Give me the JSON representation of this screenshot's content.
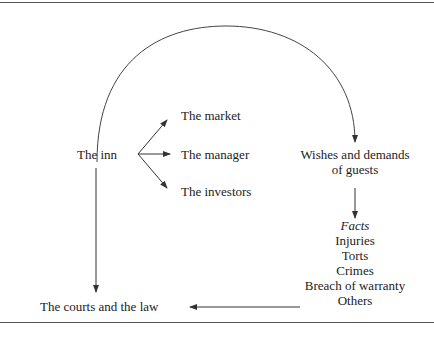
{
  "diagram": {
    "nodes": {
      "inn": "The inn",
      "market": "The market",
      "manager": "The manager",
      "investors": "The investors",
      "wishes_line1": "Wishes and demands",
      "wishes_line2": "of guests",
      "facts_title": "Facts",
      "facts_items": [
        "Injuries",
        "Torts",
        "Crimes",
        "Breach of warranty",
        "Others"
      ],
      "courts": "The courts and the law"
    },
    "edges": [
      {
        "from": "The inn",
        "to": "The market"
      },
      {
        "from": "The inn",
        "to": "The manager"
      },
      {
        "from": "The inn",
        "to": "The investors"
      },
      {
        "from": "The inn",
        "to": "Wishes and demands of guests",
        "shape": "arc"
      },
      {
        "from": "Wishes and demands of guests",
        "to": "Facts"
      },
      {
        "from": "Facts",
        "to": "The courts and the law"
      },
      {
        "from": "The inn",
        "to": "The courts and the law"
      }
    ]
  }
}
